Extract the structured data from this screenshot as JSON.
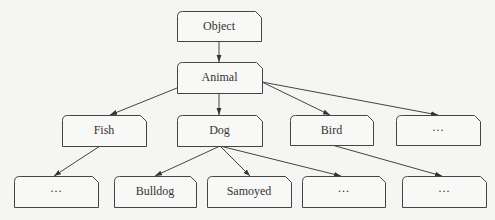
{
  "diagram": {
    "type": "class-hierarchy-tree",
    "colors": {
      "background": "#f5f5f3",
      "stroke": "#444444",
      "text": "#333333"
    },
    "nodes": [
      {
        "id": "object",
        "label": "Object",
        "x": 177,
        "y": 11,
        "w": 84,
        "h": 30
      },
      {
        "id": "animal",
        "label": "Animal",
        "x": 177,
        "y": 62,
        "w": 85,
        "h": 31
      },
      {
        "id": "fish",
        "label": "Fish",
        "x": 62,
        "y": 115,
        "w": 84,
        "h": 31
      },
      {
        "id": "dog",
        "label": "Dog",
        "x": 177,
        "y": 115,
        "w": 85,
        "h": 31
      },
      {
        "id": "bird",
        "label": "Bird",
        "x": 290,
        "y": 115,
        "w": 83,
        "h": 30
      },
      {
        "id": "animal-more",
        "label": "···",
        "x": 396,
        "y": 115,
        "w": 84,
        "h": 30
      },
      {
        "id": "fish-more",
        "label": "···",
        "x": 14,
        "y": 176,
        "w": 84,
        "h": 31
      },
      {
        "id": "bulldog",
        "label": "Bulldog",
        "x": 114,
        "y": 176,
        "w": 82,
        "h": 31
      },
      {
        "id": "samoyed",
        "label": "Samoyed",
        "x": 207,
        "y": 176,
        "w": 84,
        "h": 31
      },
      {
        "id": "dog-more",
        "label": "···",
        "x": 302,
        "y": 176,
        "w": 83,
        "h": 31
      },
      {
        "id": "bird-more",
        "label": "···",
        "x": 402,
        "y": 176,
        "w": 84,
        "h": 31
      }
    ],
    "edges": [
      {
        "from": "object",
        "to": "animal",
        "x1": 219,
        "y1": 41,
        "x2": 219,
        "y2": 62
      },
      {
        "from": "animal",
        "to": "fish",
        "x1": 177,
        "y1": 88,
        "x2": 110,
        "y2": 115
      },
      {
        "from": "animal",
        "to": "dog",
        "x1": 219,
        "y1": 93,
        "x2": 219,
        "y2": 115
      },
      {
        "from": "animal",
        "to": "bird",
        "x1": 262,
        "y1": 82,
        "x2": 330,
        "y2": 115
      },
      {
        "from": "animal",
        "to": "animal-more",
        "x1": 262,
        "y1": 82,
        "x2": 438,
        "y2": 115
      },
      {
        "from": "fish",
        "to": "fish-more",
        "x1": 100,
        "y1": 146,
        "x2": 54,
        "y2": 176
      },
      {
        "from": "dog",
        "to": "bulldog",
        "x1": 220,
        "y1": 146,
        "x2": 155,
        "y2": 176
      },
      {
        "from": "dog",
        "to": "samoyed",
        "x1": 220,
        "y1": 146,
        "x2": 250,
        "y2": 176
      },
      {
        "from": "dog",
        "to": "dog-more",
        "x1": 220,
        "y1": 146,
        "x2": 341,
        "y2": 176
      },
      {
        "from": "bird",
        "to": "bird-more",
        "x1": 332,
        "y1": 145,
        "x2": 442,
        "y2": 176
      }
    ]
  }
}
